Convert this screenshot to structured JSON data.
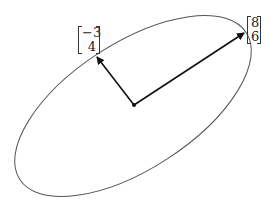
{
  "diagram": {
    "colors": {
      "ellipse": "#555555",
      "arrow": "#111111"
    },
    "center": {
      "x": 134,
      "y": 105
    },
    "vectors": [
      {
        "name": "v1",
        "components": [
          "8",
          "6"
        ],
        "tip": {
          "x": 244,
          "y": 33
        }
      },
      {
        "name": "v2",
        "components": [
          "-3",
          "4"
        ],
        "tip": {
          "x": 97,
          "y": 57
        }
      }
    ],
    "labels": {
      "v1_top": "8",
      "v1_bottom": "6",
      "v2_top": "−3",
      "v2_bottom": "4"
    }
  }
}
